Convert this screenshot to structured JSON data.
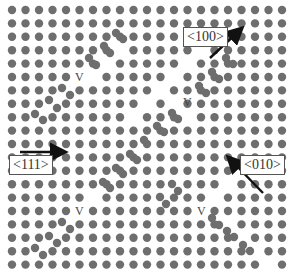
{
  "figure": {
    "background": "#ffffff",
    "atom_color": "#6e6e6e",
    "atom_highlight": "#9a9a9a",
    "lattice": {
      "columns": 21,
      "rows": 20,
      "origin_x": 12,
      "origin_y": 10,
      "pitch_x": 13.5,
      "pitch_y": 13.4,
      "atom_radius": 4.2
    },
    "removed_sites": [
      [
        5,
        5
      ],
      [
        6,
        5
      ],
      [
        7,
        4
      ],
      [
        8,
        3
      ],
      [
        4,
        6
      ],
      [
        3,
        7
      ],
      [
        2,
        8
      ],
      [
        13,
        4
      ],
      [
        14,
        3
      ],
      [
        15,
        2
      ],
      [
        12,
        5
      ],
      [
        11,
        6
      ],
      [
        10,
        7
      ],
      [
        9,
        8
      ],
      [
        12,
        7
      ],
      [
        13,
        8
      ],
      [
        5,
        15
      ],
      [
        6,
        14
      ],
      [
        4,
        16
      ],
      [
        3,
        17
      ],
      [
        2,
        18
      ],
      [
        16,
        13
      ],
      [
        17,
        12
      ],
      [
        15,
        14
      ],
      [
        14,
        15
      ],
      [
        12,
        13
      ],
      [
        11,
        14
      ],
      [
        16,
        16
      ],
      [
        17,
        17
      ],
      [
        18,
        18
      ],
      [
        19,
        19
      ]
    ],
    "displaced_atoms": [
      [
        116,
        33
      ],
      [
        123,
        39
      ],
      [
        104,
        46
      ],
      [
        110,
        53
      ],
      [
        89,
        58
      ],
      [
        96,
        65
      ],
      [
        62,
        88
      ],
      [
        70,
        95
      ],
      [
        49,
        100
      ],
      [
        57,
        108
      ],
      [
        35,
        114
      ],
      [
        43,
        120
      ],
      [
        226,
        58
      ],
      [
        233,
        64
      ],
      [
        212,
        72
      ],
      [
        219,
        79
      ],
      [
        199,
        86
      ],
      [
        206,
        93
      ],
      [
        172,
        113
      ],
      [
        178,
        119
      ],
      [
        157,
        126
      ],
      [
        164,
        132
      ],
      [
        144,
        140
      ],
      [
        130,
        154
      ],
      [
        137,
        160
      ],
      [
        116,
        168
      ],
      [
        123,
        174
      ],
      [
        103,
        182
      ],
      [
        110,
        188
      ],
      [
        62,
        222
      ],
      [
        70,
        229
      ],
      [
        49,
        236
      ],
      [
        57,
        243
      ],
      [
        35,
        248
      ],
      [
        43,
        255
      ],
      [
        172,
        184
      ],
      [
        178,
        191
      ],
      [
        160,
        197
      ],
      [
        166,
        204
      ],
      [
        212,
        218
      ],
      [
        219,
        225
      ],
      [
        227,
        231
      ],
      [
        234,
        237
      ],
      [
        243,
        245
      ],
      [
        250,
        251
      ]
    ],
    "vacancies": [
      {
        "label": "V",
        "x": 75,
        "y": 71
      },
      {
        "label": "V",
        "x": 183,
        "y": 96
      },
      {
        "label": "V",
        "x": 75,
        "y": 205
      },
      {
        "label": "V",
        "x": 197,
        "y": 205
      }
    ],
    "directions": [
      {
        "label": "<100>",
        "box_x": 183,
        "box_y": 27,
        "arrow": [
          210,
          58,
          241,
          29
        ]
      },
      {
        "label": "<111>",
        "box_x": 9,
        "box_y": 155,
        "arrow": [
          20,
          152,
          64,
          152
        ]
      },
      {
        "label": "<010>",
        "box_x": 240,
        "box_y": 155,
        "arrow": [
          263,
          193,
          229,
          158
        ]
      }
    ]
  }
}
